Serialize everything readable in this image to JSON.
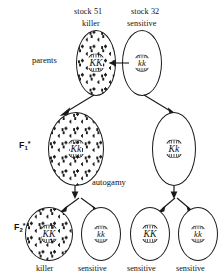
{
  "diagram": {
    "title_labels": {
      "left_stock": "stock 51",
      "left_pheno": "killer",
      "right_stock": "stock 32",
      "right_pheno": "sensitive"
    },
    "generations": {
      "parents": "parents",
      "f1_letter": "F",
      "f1_sub": "1",
      "f1_sup": "*",
      "f2_letter": "F",
      "f2_sub": "2",
      "f2_sup": "*"
    },
    "process_label": "autogamy",
    "parents_row": [
      {
        "genotype": "KK",
        "phenotype": "killer",
        "stock": "stock 51",
        "stippled": true
      },
      {
        "genotype": "kk",
        "phenotype": "sensitive",
        "stock": "stock 32",
        "stippled": false
      }
    ],
    "f1_row": [
      {
        "genotype": "Kk",
        "stippled": true
      },
      {
        "genotype": "Kk",
        "stippled": false
      }
    ],
    "f2_row": [
      {
        "genotype": "KK",
        "phenotype": "killer",
        "stippled": true
      },
      {
        "genotype": "kk",
        "phenotype": "sensitive",
        "stippled": false
      },
      {
        "genotype": "KK",
        "phenotype": "sensitive",
        "stippled": false
      },
      {
        "genotype": "kk",
        "phenotype": "sensitive",
        "stippled": false
      }
    ],
    "colors": {
      "ink": "#1a1a1a",
      "background": "#ffffff"
    }
  }
}
